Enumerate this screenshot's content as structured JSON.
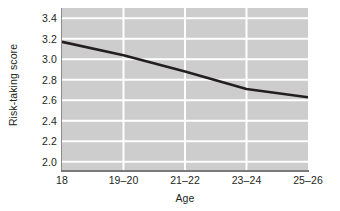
{
  "chart_data": {
    "type": "line",
    "title": "",
    "xlabel": "Age",
    "ylabel": "Risk-taking score",
    "categories": [
      "18",
      "19–20",
      "21–22",
      "23–24",
      "25–26"
    ],
    "x_tick_labels": [
      "18",
      "19–20",
      "21–22",
      "23–24",
      "25–26"
    ],
    "y_tick_labels": [
      "3.4",
      "3.2",
      "3.0",
      "2.8",
      "2.6",
      "2.4",
      "2.2",
      "2.0"
    ],
    "y_ticks": [
      3.4,
      3.2,
      3.0,
      2.8,
      2.6,
      2.4,
      2.2,
      2.0
    ],
    "values": [
      3.17,
      3.04,
      2.88,
      2.71,
      2.63
    ],
    "series": [
      {
        "name": "Risk-taking score",
        "values": [
          3.17,
          3.04,
          2.88,
          2.71,
          2.63
        ]
      }
    ],
    "ylim": [
      1.92,
      3.5
    ],
    "xlim": [
      0,
      4
    ],
    "grid": true,
    "grid_axis": "both",
    "grid_color": "#ffffff",
    "plot_background": "#cdcdcd",
    "line_color": "#231f20",
    "line_width": 2.6,
    "legend": false,
    "legend_position": "none",
    "markers": false,
    "annotations": []
  },
  "figure": {
    "background": "#ffffff",
    "text_color": "#231f20"
  }
}
